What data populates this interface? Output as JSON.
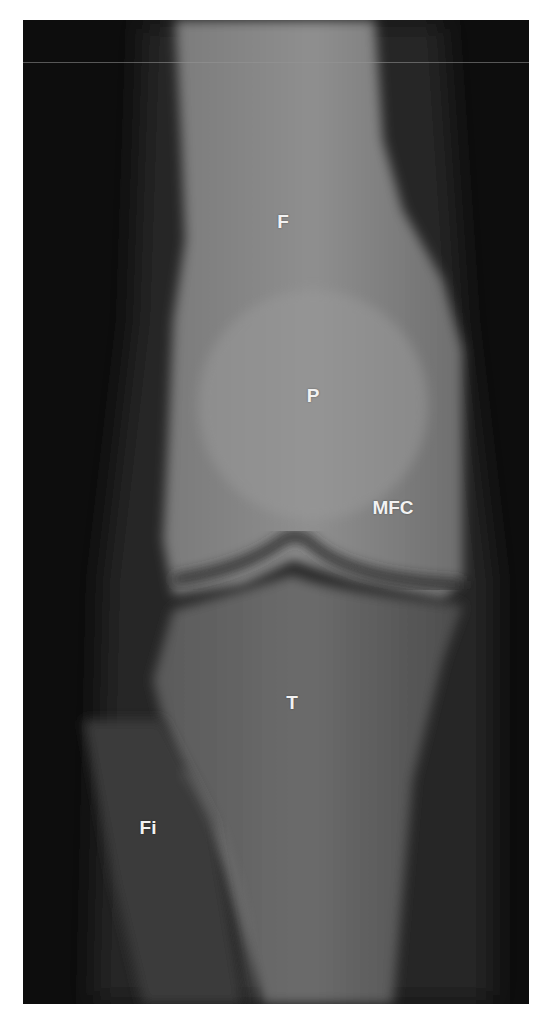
{
  "figure": {
    "labels": [
      {
        "id": "F",
        "text": "F",
        "x": 283,
        "y": 222
      },
      {
        "id": "P",
        "text": "P",
        "x": 313,
        "y": 396
      },
      {
        "id": "MFC",
        "text": "MFC",
        "x": 393,
        "y": 508
      },
      {
        "id": "T",
        "text": "T",
        "x": 292,
        "y": 703
      },
      {
        "id": "Fi",
        "text": "Fi",
        "x": 148,
        "y": 828
      }
    ],
    "colors": {
      "background": "#0b0b0b",
      "bone": "#8a8a8a",
      "label": "#f2f2f2",
      "frame": "#ffffff"
    }
  }
}
